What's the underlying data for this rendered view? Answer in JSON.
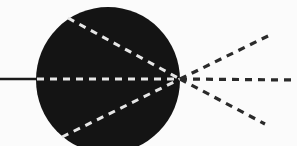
{
  "diagram": {
    "type": "optics-ray-diagram",
    "colors": {
      "background": "#fbfbfb",
      "sphere": "#141414",
      "incoming_ray": "#1a1a1a",
      "inner_rays": "#e6e6e6",
      "outgoing_rays": "#2a2a2a"
    },
    "sphere": {
      "cx": 108,
      "cy": 80,
      "rx": 72,
      "ry": 73
    },
    "focal_point": {
      "x": 180,
      "y": 79
    },
    "incoming_ray": {
      "x1": 0,
      "y1": 79,
      "x2": 36,
      "y2": 79,
      "style": "solid"
    },
    "inner_rays": [
      {
        "name": "upper",
        "x1": 68,
        "y1": 18,
        "x2": 180,
        "y2": 79,
        "style": "dashed"
      },
      {
        "name": "center",
        "x1": 37,
        "y1": 79,
        "x2": 180,
        "y2": 79,
        "style": "dashed"
      },
      {
        "name": "lower",
        "x1": 62,
        "y1": 137,
        "x2": 180,
        "y2": 79,
        "style": "dashed"
      }
    ],
    "outgoing_rays": [
      {
        "name": "upper",
        "x1": 180,
        "y1": 79,
        "x2": 270,
        "y2": 35,
        "style": "dashed"
      },
      {
        "name": "center",
        "x1": 180,
        "y1": 79,
        "x2": 297,
        "y2": 80,
        "style": "dashed"
      },
      {
        "name": "lower",
        "x1": 180,
        "y1": 79,
        "x2": 265,
        "y2": 124,
        "style": "dashed"
      }
    ]
  }
}
